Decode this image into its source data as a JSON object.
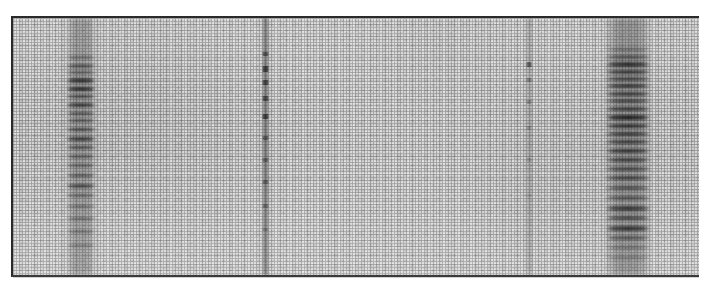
{
  "figure": {
    "kind": "gel-electrophoresis-autoradiograph",
    "caption": "",
    "plate": {
      "x": 11,
      "y": 16,
      "width": 688,
      "height": 261,
      "border_color": "#2a2a2a",
      "background_color": "#e9e9e9",
      "noise": "halftone-scan-grain"
    }
  },
  "chart_data": {
    "type": "heatmap",
    "title": "",
    "subtitle": "",
    "xlabel": "",
    "ylabel": "",
    "grid": false,
    "legend_position": "none",
    "axis_ranges": {
      "x": [
        0,
        688
      ],
      "y": [
        0,
        261
      ]
    },
    "lanes": [
      {
        "id": "lane-1",
        "label": "1",
        "center_x": 68,
        "width": 30,
        "intensity": "strong",
        "smear_opacity": 0.34,
        "bands": [
          {
            "y": 38,
            "height": 3,
            "darkness": 0.3
          },
          {
            "y": 46,
            "height": 4,
            "darkness": 0.42
          },
          {
            "y": 53,
            "height": 3,
            "darkness": 0.38
          },
          {
            "y": 60,
            "height": 5,
            "darkness": 0.62
          },
          {
            "y": 69,
            "height": 4,
            "darkness": 0.7
          },
          {
            "y": 77,
            "height": 3,
            "darkness": 0.52
          },
          {
            "y": 85,
            "height": 4,
            "darkness": 0.58
          },
          {
            "y": 94,
            "height": 3,
            "darkness": 0.44
          },
          {
            "y": 101,
            "height": 3,
            "darkness": 0.4
          },
          {
            "y": 110,
            "height": 3,
            "darkness": 0.5
          },
          {
            "y": 119,
            "height": 4,
            "darkness": 0.56
          },
          {
            "y": 128,
            "height": 3,
            "darkness": 0.46
          },
          {
            "y": 137,
            "height": 3,
            "darkness": 0.38
          },
          {
            "y": 146,
            "height": 3,
            "darkness": 0.34
          },
          {
            "y": 156,
            "height": 3,
            "darkness": 0.42
          },
          {
            "y": 166,
            "height": 4,
            "darkness": 0.5
          },
          {
            "y": 176,
            "height": 3,
            "darkness": 0.36
          },
          {
            "y": 187,
            "height": 3,
            "darkness": 0.3
          },
          {
            "y": 199,
            "height": 3,
            "darkness": 0.34
          },
          {
            "y": 212,
            "height": 3,
            "darkness": 0.28
          },
          {
            "y": 226,
            "height": 3,
            "darkness": 0.24
          }
        ]
      },
      {
        "id": "lane-2",
        "label": "2",
        "center_x": 252,
        "width": 7,
        "intensity": "thin-streak",
        "smear_opacity": 0.52,
        "bands": [
          {
            "y": 34,
            "height": 4,
            "darkness": 0.46
          },
          {
            "y": 48,
            "height": 6,
            "darkness": 0.6
          },
          {
            "y": 62,
            "height": 5,
            "darkness": 0.55
          },
          {
            "y": 78,
            "height": 5,
            "darkness": 0.5
          },
          {
            "y": 96,
            "height": 5,
            "darkness": 0.58
          },
          {
            "y": 118,
            "height": 4,
            "darkness": 0.4
          },
          {
            "y": 140,
            "height": 4,
            "darkness": 0.34
          },
          {
            "y": 162,
            "height": 4,
            "darkness": 0.36
          },
          {
            "y": 186,
            "height": 4,
            "darkness": 0.3
          },
          {
            "y": 210,
            "height": 3,
            "darkness": 0.22
          }
        ]
      },
      {
        "id": "lane-3",
        "label": "3",
        "center_x": 516,
        "width": 6,
        "intensity": "faint",
        "smear_opacity": 0.26,
        "bands": [
          {
            "y": 44,
            "height": 5,
            "darkness": 0.48
          },
          {
            "y": 60,
            "height": 4,
            "darkness": 0.26
          },
          {
            "y": 82,
            "height": 4,
            "darkness": 0.22
          },
          {
            "y": 108,
            "height": 4,
            "darkness": 0.2
          },
          {
            "y": 140,
            "height": 4,
            "darkness": 0.16
          },
          {
            "y": 176,
            "height": 3,
            "darkness": 0.12
          }
        ]
      },
      {
        "id": "lane-4",
        "label": "4",
        "center_x": 615,
        "width": 46,
        "intensity": "very-strong",
        "smear_opacity": 0.4,
        "bands": [
          {
            "y": 30,
            "height": 3,
            "darkness": 0.28
          },
          {
            "y": 37,
            "height": 4,
            "darkness": 0.4
          },
          {
            "y": 44,
            "height": 5,
            "darkness": 0.66
          },
          {
            "y": 52,
            "height": 4,
            "darkness": 0.58
          },
          {
            "y": 59,
            "height": 4,
            "darkness": 0.5
          },
          {
            "y": 66,
            "height": 4,
            "darkness": 0.6
          },
          {
            "y": 74,
            "height": 4,
            "darkness": 0.54
          },
          {
            "y": 81,
            "height": 4,
            "darkness": 0.48
          },
          {
            "y": 89,
            "height": 4,
            "darkness": 0.56
          },
          {
            "y": 97,
            "height": 5,
            "darkness": 0.72
          },
          {
            "y": 106,
            "height": 4,
            "darkness": 0.62
          },
          {
            "y": 114,
            "height": 4,
            "darkness": 0.55
          },
          {
            "y": 122,
            "height": 4,
            "darkness": 0.5
          },
          {
            "y": 131,
            "height": 4,
            "darkness": 0.58
          },
          {
            "y": 140,
            "height": 4,
            "darkness": 0.52
          },
          {
            "y": 149,
            "height": 4,
            "darkness": 0.46
          },
          {
            "y": 158,
            "height": 4,
            "darkness": 0.5
          },
          {
            "y": 168,
            "height": 4,
            "darkness": 0.44
          },
          {
            "y": 178,
            "height": 4,
            "darkness": 0.42
          },
          {
            "y": 188,
            "height": 5,
            "darkness": 0.62
          },
          {
            "y": 198,
            "height": 4,
            "darkness": 0.54
          },
          {
            "y": 208,
            "height": 5,
            "darkness": 0.66
          },
          {
            "y": 218,
            "height": 4,
            "darkness": 0.44
          },
          {
            "y": 228,
            "height": 3,
            "darkness": 0.3
          },
          {
            "y": 238,
            "height": 3,
            "darkness": 0.24
          }
        ]
      }
    ]
  }
}
